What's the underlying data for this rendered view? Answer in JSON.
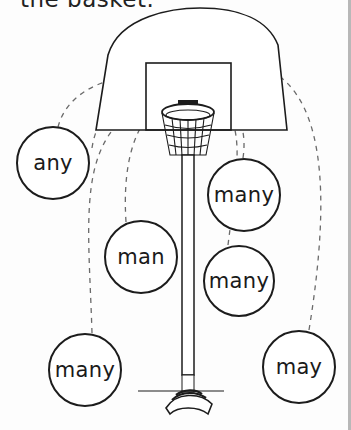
{
  "worksheet": {
    "instruction_fragment": "the basket.",
    "illustration": "basketball-hoop-on-pole",
    "words": [
      {
        "text": "any",
        "cx": 53,
        "cy": 163,
        "r": 37
      },
      {
        "text": "many",
        "cx": 244,
        "cy": 195,
        "r": 37
      },
      {
        "text": "man",
        "cx": 141,
        "cy": 257,
        "r": 37
      },
      {
        "text": "many",
        "cx": 239,
        "cy": 281,
        "r": 36
      },
      {
        "text": "many",
        "cx": 85,
        "cy": 370,
        "r": 37
      },
      {
        "text": "may",
        "cx": 299,
        "cy": 367,
        "r": 37
      }
    ],
    "colors": {
      "ink": "#1c1c1c",
      "dash": "#666666",
      "paper": "#fdfdfd"
    }
  }
}
